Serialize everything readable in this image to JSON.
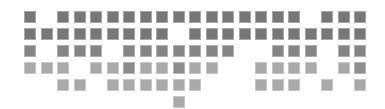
{
  "grid": {
    "columns": 21,
    "rows": 6,
    "origin_x": 24,
    "origin_y": 11,
    "pitch_x": 16.5,
    "pitch_y": 17,
    "cell_size": 12,
    "colors": {
      "d": "#777777",
      "m": "#858585",
      "l": "#a9a9a9",
      "x": "#8c8c8c"
    },
    "cells": [
      "d.dddddddddddddd.ddd",
      "ddddddddd.ddddddddddd",
      "m.mmm.mmmmmmm..mmm.mm",
      "lll.llxllxll..llll.lx",
      "..ll.llllll...lll.l.l",
      ".........l..........."
    ]
  }
}
